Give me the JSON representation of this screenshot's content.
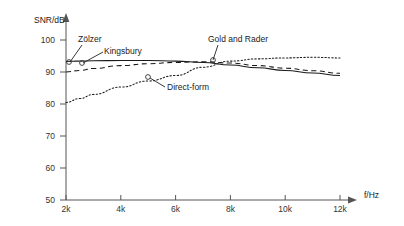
{
  "chart_data": {
    "type": "line",
    "title": "",
    "xlabel": "f/Hz",
    "ylabel": "SNR/dB",
    "xlim": [
      2000,
      12000
    ],
    "ylim": [
      50,
      100
    ],
    "grid": false,
    "legend": "inline-annotations",
    "x_ticks": [
      {
        "value": 2000,
        "label": "2k"
      },
      {
        "value": 4000,
        "label": "4k"
      },
      {
        "value": 6000,
        "label": "6k"
      },
      {
        "value": 8000,
        "label": "8k"
      },
      {
        "value": 10000,
        "label": "10k"
      },
      {
        "value": 12000,
        "label": "12k"
      }
    ],
    "y_ticks": [
      {
        "value": 50,
        "label": "50"
      },
      {
        "value": 60,
        "label": "60"
      },
      {
        "value": 70,
        "label": "70"
      },
      {
        "value": 80,
        "label": "80"
      },
      {
        "value": 90,
        "label": "90"
      },
      {
        "value": 100,
        "label": "100"
      }
    ],
    "series": [
      {
        "name": "Zölzer",
        "style": "solid",
        "x": [
          2000,
          2400,
          3000,
          4000,
          5000,
          6000,
          7000,
          8000,
          9000,
          10000,
          11000,
          12000
        ],
        "values": [
          93.3,
          93.4,
          93.5,
          93.6,
          93.6,
          93.4,
          93.0,
          92.2,
          91.3,
          90.5,
          89.7,
          88.9
        ]
      },
      {
        "name": "Kingsbury",
        "style": "dashed",
        "x": [
          2000,
          2500,
          3000,
          4000,
          5000,
          6000,
          7000,
          8000,
          9000,
          10000,
          11000,
          12000
        ],
        "values": [
          90.0,
          90.5,
          91.1,
          92.0,
          92.6,
          93.0,
          93.2,
          92.8,
          92.0,
          91.2,
          90.4,
          89.6
        ]
      },
      {
        "name": "Gold and Rader",
        "style": "dotted",
        "x": [
          2000,
          2500,
          3000,
          4000,
          5000,
          6000,
          7000,
          8000,
          9000,
          10000,
          11000,
          12000
        ],
        "values": [
          80.5,
          81.7,
          83.0,
          85.3,
          87.2,
          88.9,
          91.5,
          93.4,
          94.1,
          94.4,
          94.6,
          94.4
        ]
      }
    ],
    "annotations": [
      {
        "label": "Zölzer",
        "text_x": 78,
        "text_y": 42,
        "leader_from": [
          82,
          45
        ],
        "leader_to": [
          70,
          62
        ],
        "marker": [
          69,
          62
        ]
      },
      {
        "label": "Kingsbury",
        "text_x": 104,
        "text_y": 54,
        "leader_from": [
          103,
          52
        ],
        "leader_to": [
          83,
          63
        ],
        "marker": [
          82,
          63
        ]
      },
      {
        "label": "Gold and Rader",
        "text_x": 208,
        "text_y": 42,
        "leader_from": [
          218,
          45
        ],
        "leader_to": [
          213,
          60
        ],
        "marker": [
          213,
          60
        ]
      },
      {
        "label": "Direct-form",
        "text_x": 167,
        "text_y": 90,
        "leader_from": [
          165,
          87
        ],
        "leader_to": [
          150,
          78
        ],
        "marker": [
          148,
          77
        ]
      }
    ],
    "colors": {
      "axis": "#555555",
      "line": "#1a1a1a",
      "text": "#222222",
      "background": "#ffffff"
    }
  }
}
